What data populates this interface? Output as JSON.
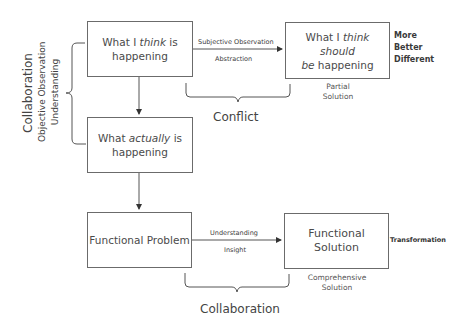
{
  "boxes": {
    "think_is": {
      "pre": "What I ",
      "em": "think",
      "post": " is happening"
    },
    "think_should": {
      "pre": "What I ",
      "em": "think should",
      "mid": " be",
      "post": " happening"
    },
    "actually": {
      "pre": "What ",
      "em": "actually",
      "post": " is happening"
    },
    "problem": {
      "text": "Functional Problem"
    },
    "solution": {
      "text": "Functional Solution"
    }
  },
  "top_arrow": {
    "above": "Subjective Observation",
    "below": "Abstraction"
  },
  "bottom_arrow": {
    "above": "Understanding",
    "below": "Insight"
  },
  "top_right_labels": [
    "More",
    "Better",
    "Different"
  ],
  "partial_solution": [
    "Partial",
    "Solution"
  ],
  "comprehensive_solution": [
    "Comprehensive",
    "Solution"
  ],
  "transformation": "Transformation",
  "conflict": "Conflict",
  "bottom_collaboration": "Collaboration",
  "left_labels": {
    "title": "Collaboration",
    "line1": "Objective Observation",
    "line2": "Understanding"
  }
}
